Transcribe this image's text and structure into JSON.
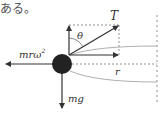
{
  "text": {
    "fragment": "ある。"
  },
  "diagram": {
    "labels": {
      "tension": "T",
      "angle": "θ",
      "centrifugal_m": "mrω",
      "centrifugal_exp": "2",
      "gravity": "mg",
      "radius": "r"
    },
    "colors": {
      "ink": "#333333",
      "ball": "#222222",
      "dashed": "#777777",
      "curve": "#999999"
    }
  }
}
